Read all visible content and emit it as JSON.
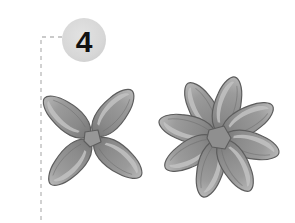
{
  "page": {
    "background_color": "#ffffff",
    "width": 295,
    "height": 223
  },
  "step_badge": {
    "number": "4",
    "shape": "circle",
    "circle_color": "#d9d9d9",
    "text_color": "#111111",
    "center": {
      "x": 84,
      "y": 40
    },
    "radius": 22
  },
  "guide_line": {
    "name": "dashed-alignment-guide",
    "style": "dashed",
    "color": "#b9b9b9",
    "path": "M62,37 L41,37 L41,223",
    "dash": "4 4"
  },
  "figures": [
    {
      "id": "flower-left",
      "label": "four-petal-flower",
      "petal_count": 4,
      "center": {
        "x": 92,
        "y": 138
      },
      "petal_angles_deg": [
        40,
        128,
        222,
        310
      ],
      "petal_length": 62,
      "petal_width": 27
    },
    {
      "id": "flower-right",
      "label": "eight-petal-flower",
      "petal_count": 8,
      "center": {
        "x": 219,
        "y": 137
      },
      "petal_angles_deg": [
        15,
        60,
        105,
        150,
        195,
        240,
        285,
        330
      ],
      "petal_length": 64,
      "petal_width": 27
    }
  ],
  "palette": {
    "petal_fill": "#8e8e8e",
    "petal_fill_light": "#a6a6a6",
    "petal_highlight": "#bdbdbd",
    "petal_shadow": "#6f6f6f",
    "petal_outline": "#5a5a5a",
    "center_fill": "#949494",
    "center_outline": "#5a5a5a",
    "badge_fill": "#d9d9d9",
    "guide_stroke": "#b9b9b9",
    "background": "#ffffff"
  }
}
